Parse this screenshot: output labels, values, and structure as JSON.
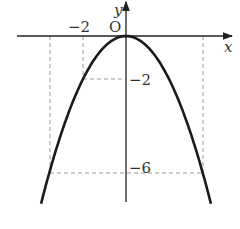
{
  "chart_data": {
    "type": "line",
    "title": "",
    "function": "y = -x^2/2",
    "xlabel": "x",
    "ylabel": "y",
    "origin_label": "O",
    "annotations": [
      {
        "label": "-2",
        "axis": "x",
        "value": -2
      },
      {
        "label": "-2",
        "axis": "y",
        "value": -2
      },
      {
        "label": "-6",
        "axis": "y",
        "value": -6
      }
    ],
    "points": [
      {
        "x": -2,
        "y": -2
      },
      {
        "x": 0,
        "y": 0
      },
      {
        "x": -3.46,
        "y": -6
      },
      {
        "x": 3.46,
        "y": -6
      }
    ],
    "series": [
      {
        "name": "parabola",
        "x": [
          -3.9,
          -3,
          -2,
          -1,
          0,
          1,
          2,
          3,
          3.9
        ],
        "values": [
          -7.6,
          -4.5,
          -2,
          -0.5,
          0,
          -0.5,
          -2,
          -4.5,
          -7.6
        ]
      }
    ],
    "grid": false,
    "colors": {
      "curve": "#1a1a1a",
      "axis": "#222222",
      "dash": "#999999"
    }
  }
}
